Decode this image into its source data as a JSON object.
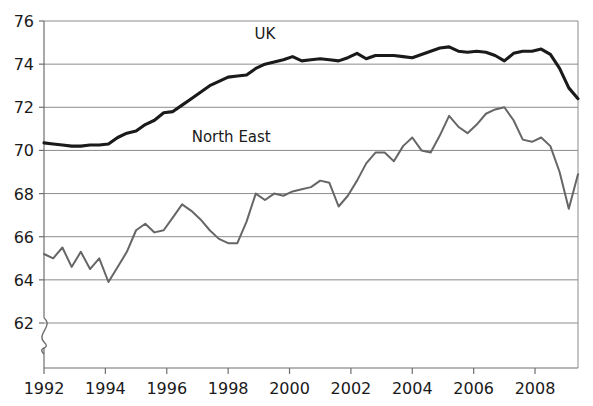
{
  "chart_data": {
    "type": "line",
    "title": "",
    "subtitle": "",
    "xlabel": "",
    "ylabel": "",
    "xlim": [
      1992.0,
      2009.4
    ],
    "ylim": [
      61.0,
      76.0
    ],
    "y_axis_break": true,
    "y_axis_break_symbol": "squiggle",
    "grid": true,
    "grid_axis": "y",
    "legend": "inline-labels",
    "xticks": [
      1992,
      1994,
      1996,
      1998,
      2000,
      2002,
      2004,
      2006,
      2008
    ],
    "xtick_labels": [
      "1992",
      "1994",
      "1996",
      "1998",
      "2000",
      "2002",
      "2004",
      "2006",
      "2008"
    ],
    "yticks": [
      62,
      64,
      66,
      68,
      70,
      72,
      74,
      76
    ],
    "ytick_labels": [
      "62",
      "64",
      "66",
      "68",
      "70",
      "72",
      "74",
      "76"
    ],
    "annotations": [
      {
        "text": "UK",
        "x": 1999.2,
        "y": 75.15
      },
      {
        "text": "North East",
        "x": 1998.1,
        "y": 70.4
      }
    ],
    "series": [
      {
        "name": "UK",
        "color": "#1a1a1a",
        "line_width": 3.1,
        "x": [
          1992.0,
          1992.3,
          1992.6,
          1992.9,
          1993.2,
          1993.5,
          1993.8,
          1994.1,
          1994.4,
          1994.7,
          1995.0,
          1995.3,
          1995.6,
          1995.9,
          1996.2,
          1996.5,
          1996.8,
          1997.1,
          1997.4,
          1997.7,
          1998.0,
          1998.3,
          1998.6,
          1998.9,
          1999.2,
          1999.5,
          1999.8,
          2000.1,
          2000.4,
          2000.7,
          2001.0,
          2001.3,
          2001.6,
          2001.9,
          2002.2,
          2002.5,
          2002.8,
          2003.1,
          2003.4,
          2003.7,
          2004.0,
          2004.3,
          2004.6,
          2004.9,
          2005.2,
          2005.5,
          2005.8,
          2006.1,
          2006.4,
          2006.7,
          2007.0,
          2007.3,
          2007.6,
          2007.9,
          2008.2,
          2008.5,
          2008.8,
          2009.1,
          2009.4
        ],
        "y": [
          70.35,
          70.3,
          70.25,
          70.2,
          70.2,
          70.25,
          70.25,
          70.3,
          70.6,
          70.8,
          70.9,
          71.2,
          71.4,
          71.75,
          71.8,
          72.1,
          72.4,
          72.7,
          73.0,
          73.2,
          73.4,
          73.45,
          73.5,
          73.8,
          74.0,
          74.1,
          74.2,
          74.35,
          74.15,
          74.2,
          74.25,
          74.2,
          74.15,
          74.3,
          74.5,
          74.25,
          74.4,
          74.4,
          74.4,
          74.35,
          74.3,
          74.45,
          74.6,
          74.75,
          74.8,
          74.6,
          74.55,
          74.6,
          74.55,
          74.4,
          74.15,
          74.5,
          74.6,
          74.6,
          74.7,
          74.45,
          73.8,
          72.9,
          72.4
        ]
      },
      {
        "name": "North East",
        "color": "#666666",
        "line_width": 2.0,
        "x": [
          1992.0,
          1992.3,
          1992.6,
          1992.9,
          1993.2,
          1993.5,
          1993.8,
          1994.1,
          1994.4,
          1994.7,
          1995.0,
          1995.3,
          1995.6,
          1995.9,
          1996.2,
          1996.5,
          1996.8,
          1997.1,
          1997.4,
          1997.7,
          1998.0,
          1998.3,
          1998.6,
          1998.9,
          1999.2,
          1999.5,
          1999.8,
          2000.1,
          2000.4,
          2000.7,
          2001.0,
          2001.3,
          2001.6,
          2001.9,
          2002.2,
          2002.5,
          2002.8,
          2003.1,
          2003.4,
          2003.7,
          2004.0,
          2004.3,
          2004.6,
          2004.9,
          2005.2,
          2005.5,
          2005.8,
          2006.1,
          2006.4,
          2006.7,
          2007.0,
          2007.3,
          2007.6,
          2007.9,
          2008.2,
          2008.5,
          2008.8,
          2009.1,
          2009.4
        ],
        "y": [
          65.2,
          65.0,
          65.5,
          64.6,
          65.3,
          64.5,
          65.0,
          63.9,
          64.6,
          65.3,
          66.3,
          66.6,
          66.2,
          66.3,
          66.9,
          67.5,
          67.2,
          66.8,
          66.3,
          65.9,
          65.7,
          65.7,
          66.7,
          68.0,
          67.7,
          68.0,
          67.9,
          68.1,
          68.2,
          68.3,
          68.6,
          68.5,
          67.4,
          67.9,
          68.6,
          69.4,
          69.9,
          69.9,
          69.5,
          70.2,
          70.6,
          70.0,
          69.9,
          70.7,
          71.6,
          71.1,
          70.8,
          71.2,
          71.7,
          71.9,
          72.0,
          71.4,
          70.5,
          70.4,
          70.6,
          70.2,
          69.0,
          67.3,
          68.9
        ]
      }
    ]
  },
  "axes": {
    "plot_left_px": 44,
    "plot_right_px": 578,
    "plot_top_px": 21,
    "plot_bottom_px": 368
  }
}
